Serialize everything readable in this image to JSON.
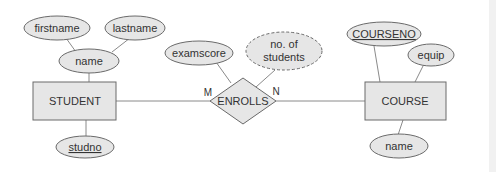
{
  "diagram": {
    "type": "ER diagram",
    "colors": {
      "fill": "#e6e6e6",
      "stroke": "#6a6a6a",
      "line": "#8a8a8a",
      "text": "#333333"
    },
    "entities": [
      {
        "id": "student",
        "label": "STUDENT"
      },
      {
        "id": "course",
        "label": "COURSE"
      }
    ],
    "relationship": {
      "label": "ENROLLS",
      "left_cardinality": "M",
      "right_cardinality": "N"
    },
    "attributes": {
      "firstname": "firstname",
      "lastname": "lastname",
      "student_name": "name",
      "studno": "studno",
      "examscore": "examscore",
      "no_of_students_line1": "no. of",
      "no_of_students_line2": "students",
      "courseno": "COURSENO",
      "equip": "equip",
      "course_name": "name"
    }
  }
}
